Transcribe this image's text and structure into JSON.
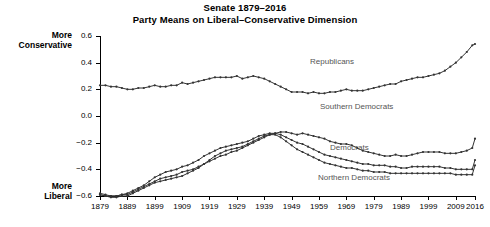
{
  "chart_data": {
    "type": "line",
    "title": "Senate 1879–2016",
    "subtitle": "Party Means on Liberal–Conservative Dimension",
    "xlabel": "",
    "ylabel": "",
    "ylim": [
      -0.6,
      0.6
    ],
    "xlim": [
      1879,
      2016
    ],
    "yticks": [
      0.6,
      0.4,
      0.2,
      0.0,
      -0.2,
      -0.4,
      -0.6
    ],
    "ytick_labels": [
      "0.6",
      "0.4",
      "0.2",
      "0.0",
      "−0.2",
      "−0.4",
      "−0.6"
    ],
    "xticks": [
      1879,
      1889,
      1899,
      1909,
      1919,
      1929,
      1939,
      1949,
      1959,
      1969,
      1979,
      1989,
      1999,
      2009,
      2016
    ],
    "xtick_labels": [
      "1879",
      "1889",
      "1899",
      "1909",
      "1919",
      "1929",
      "1939",
      "1949",
      "1959",
      "1969",
      "1979",
      "1989",
      "1999",
      "2009",
      "2016"
    ],
    "grid": false,
    "legend_position": "inline-annotations",
    "axis_notes": {
      "top": "More\nConservative",
      "top_line1": "More",
      "top_line2": "Conservative",
      "bottom_line1": "More",
      "bottom_line2": "Liberal"
    },
    "marker": "filled-circle",
    "line_color": "#333333",
    "annotations": [
      {
        "text": "Republicans",
        "x": 1964,
        "y": 0.27
      },
      {
        "text": "Southern Democrats",
        "x": 1970,
        "y": -0.06
      },
      {
        "text": "Democrats",
        "x": 1978,
        "y": -0.26
      },
      {
        "text": "Northern Democrats",
        "x": 1972,
        "y": -0.48
      }
    ],
    "x": [
      1879,
      1881,
      1883,
      1885,
      1887,
      1889,
      1891,
      1893,
      1895,
      1897,
      1899,
      1901,
      1903,
      1905,
      1907,
      1909,
      1911,
      1913,
      1915,
      1917,
      1919,
      1921,
      1923,
      1925,
      1927,
      1929,
      1931,
      1933,
      1935,
      1937,
      1939,
      1941,
      1943,
      1945,
      1947,
      1949,
      1951,
      1953,
      1955,
      1957,
      1959,
      1961,
      1963,
      1965,
      1967,
      1969,
      1971,
      1973,
      1975,
      1977,
      1979,
      1981,
      1983,
      1985,
      1987,
      1989,
      1991,
      1993,
      1995,
      1997,
      1999,
      2001,
      2003,
      2005,
      2007,
      2009,
      2011,
      2013,
      2015,
      2016
    ],
    "series": [
      {
        "name": "Republicans",
        "values": [
          0.23,
          0.23,
          0.22,
          0.22,
          0.21,
          0.2,
          0.2,
          0.21,
          0.21,
          0.22,
          0.23,
          0.22,
          0.22,
          0.23,
          0.23,
          0.25,
          0.24,
          0.25,
          0.26,
          0.27,
          0.28,
          0.29,
          0.29,
          0.29,
          0.29,
          0.3,
          0.28,
          0.29,
          0.3,
          0.29,
          0.28,
          0.26,
          0.24,
          0.22,
          0.2,
          0.18,
          0.18,
          0.18,
          0.17,
          0.18,
          0.17,
          0.17,
          0.18,
          0.18,
          0.19,
          0.2,
          0.19,
          0.19,
          0.19,
          0.2,
          0.21,
          0.22,
          0.23,
          0.24,
          0.24,
          0.26,
          0.27,
          0.28,
          0.29,
          0.29,
          0.3,
          0.31,
          0.32,
          0.34,
          0.37,
          0.4,
          0.44,
          0.48,
          0.53,
          0.54
        ]
      },
      {
        "name": "Southern Democrats",
        "values": [
          -0.58,
          -0.59,
          -0.6,
          -0.6,
          -0.59,
          -0.59,
          -0.57,
          -0.55,
          -0.53,
          -0.51,
          -0.49,
          -0.47,
          -0.46,
          -0.45,
          -0.44,
          -0.42,
          -0.41,
          -0.4,
          -0.38,
          -0.36,
          -0.34,
          -0.32,
          -0.3,
          -0.29,
          -0.27,
          -0.26,
          -0.24,
          -0.22,
          -0.2,
          -0.18,
          -0.16,
          -0.14,
          -0.13,
          -0.12,
          -0.12,
          -0.13,
          -0.14,
          -0.13,
          -0.14,
          -0.15,
          -0.16,
          -0.17,
          -0.19,
          -0.2,
          -0.21,
          -0.21,
          -0.22,
          -0.24,
          -0.26,
          -0.27,
          -0.28,
          -0.29,
          -0.3,
          -0.3,
          -0.29,
          -0.3,
          -0.3,
          -0.29,
          -0.28,
          -0.27,
          -0.27,
          -0.27,
          -0.27,
          -0.28,
          -0.28,
          -0.28,
          -0.27,
          -0.26,
          -0.24,
          -0.17
        ]
      },
      {
        "name": "Democrats",
        "values": [
          -0.59,
          -0.6,
          -0.6,
          -0.6,
          -0.59,
          -0.58,
          -0.56,
          -0.54,
          -0.52,
          -0.49,
          -0.46,
          -0.44,
          -0.42,
          -0.41,
          -0.4,
          -0.38,
          -0.37,
          -0.35,
          -0.33,
          -0.3,
          -0.28,
          -0.26,
          -0.24,
          -0.23,
          -0.22,
          -0.21,
          -0.2,
          -0.19,
          -0.17,
          -0.15,
          -0.14,
          -0.13,
          -0.13,
          -0.14,
          -0.16,
          -0.18,
          -0.2,
          -0.21,
          -0.23,
          -0.25,
          -0.27,
          -0.29,
          -0.3,
          -0.31,
          -0.32,
          -0.33,
          -0.34,
          -0.35,
          -0.36,
          -0.36,
          -0.37,
          -0.37,
          -0.37,
          -0.38,
          -0.38,
          -0.39,
          -0.39,
          -0.38,
          -0.38,
          -0.38,
          -0.38,
          -0.38,
          -0.38,
          -0.39,
          -0.39,
          -0.4,
          -0.4,
          -0.4,
          -0.4,
          -0.33
        ]
      },
      {
        "name": "Northern Democrats",
        "values": [
          -0.59,
          -0.6,
          -0.61,
          -0.61,
          -0.6,
          -0.6,
          -0.58,
          -0.56,
          -0.54,
          -0.52,
          -0.5,
          -0.49,
          -0.48,
          -0.47,
          -0.46,
          -0.45,
          -0.43,
          -0.41,
          -0.39,
          -0.36,
          -0.33,
          -0.3,
          -0.28,
          -0.26,
          -0.25,
          -0.24,
          -0.23,
          -0.21,
          -0.19,
          -0.17,
          -0.15,
          -0.14,
          -0.14,
          -0.16,
          -0.19,
          -0.22,
          -0.25,
          -0.27,
          -0.29,
          -0.31,
          -0.33,
          -0.35,
          -0.36,
          -0.37,
          -0.38,
          -0.39,
          -0.39,
          -0.4,
          -0.41,
          -0.41,
          -0.42,
          -0.42,
          -0.42,
          -0.43,
          -0.43,
          -0.43,
          -0.43,
          -0.43,
          -0.43,
          -0.43,
          -0.43,
          -0.43,
          -0.43,
          -0.43,
          -0.43,
          -0.44,
          -0.44,
          -0.44,
          -0.44,
          -0.37
        ]
      }
    ]
  }
}
